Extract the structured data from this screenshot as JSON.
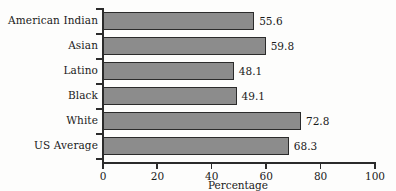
{
  "chart_data": {
    "type": "bar",
    "orientation": "horizontal",
    "title": "",
    "xlabel": "Percentage",
    "ylabel": "",
    "xlim": [
      0,
      100
    ],
    "xticks": [
      0,
      20,
      40,
      60,
      80,
      100
    ],
    "grid": false,
    "legend": null,
    "categories": [
      "American Indian",
      "Asian",
      "Latino",
      "Black",
      "White",
      "US Average"
    ],
    "values": [
      55.6,
      59.8,
      48.1,
      49.1,
      72.8,
      68.3
    ],
    "value_labels": [
      "55.6",
      "59.8",
      "48.1",
      "49.1",
      "72.8",
      "68.3"
    ],
    "series": [
      {
        "name": "Percentage",
        "values": [
          55.6,
          59.8,
          48.1,
          49.1,
          72.8,
          68.3
        ]
      }
    ],
    "colors": {
      "bar_fill": "#8c8c8c",
      "bar_edge": "#2b2b2b",
      "axis": "#2b2b2b",
      "text": "#1a1a1a",
      "background": "#fdfdfc"
    }
  },
  "axis": {
    "x_title": "Percentage",
    "tick_labels": [
      "0",
      "20",
      "40",
      "60",
      "80",
      "100"
    ]
  },
  "categories": {
    "c0": "American Indian",
    "c1": "Asian",
    "c2": "Latino",
    "c3": "Black",
    "c4": "White",
    "c5": "US Average"
  },
  "values": {
    "v0": "55.6",
    "v1": "59.8",
    "v2": "48.1",
    "v3": "49.1",
    "v4": "72.8",
    "v5": "68.3"
  }
}
